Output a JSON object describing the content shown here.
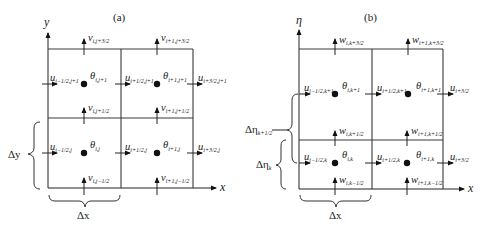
{
  "panels": [
    {
      "id": "a",
      "title": "(a)",
      "vertical_axis": "y",
      "horizontal_axis": "x",
      "dx_label": "Δx",
      "dy_label": "Δy",
      "cells": [
        {
          "theta": "θ",
          "theta_sub": "i,j+1"
        },
        {
          "theta": "θ",
          "theta_sub": "i+1,j+1"
        },
        {
          "theta": "θ",
          "theta_sub": "i,j"
        },
        {
          "theta": "θ",
          "theta_sub": "i+1,j"
        }
      ],
      "u_labels": [
        {
          "var": "u",
          "sub": "i−1/2,j+1"
        },
        {
          "var": "u",
          "sub": "i+1/2,j+1"
        },
        {
          "var": "u",
          "sub": "i+3/2,j+1"
        },
        {
          "var": "u",
          "sub": "i−1/2,j"
        },
        {
          "var": "u",
          "sub": "i+1/2,j"
        },
        {
          "var": "u",
          "sub": "i+3/2,j"
        }
      ],
      "v_labels": [
        {
          "var": "v",
          "sub": "i,j+3/2"
        },
        {
          "var": "v",
          "sub": "i+1,j+3/2"
        },
        {
          "var": "v",
          "sub": "i,j+1/2"
        },
        {
          "var": "v",
          "sub": "i+1,j+1/2"
        },
        {
          "var": "v",
          "sub": "i,j−1/2"
        },
        {
          "var": "v",
          "sub": "i+1,j−1/2"
        }
      ]
    },
    {
      "id": "b",
      "title": "(b)",
      "vertical_axis": "η",
      "horizontal_axis": "x",
      "dx_label": "Δx",
      "deta_upper_label": "Δη",
      "deta_upper_sub": "k+1/2",
      "deta_lower_label": "Δη",
      "deta_lower_sub": "k",
      "cells": [
        {
          "theta": "θ",
          "theta_sub": "i,k+1"
        },
        {
          "theta": "θ",
          "theta_sub": "i+1,k+1"
        },
        {
          "theta": "θ",
          "theta_sub": "i,k"
        },
        {
          "theta": "θ",
          "theta_sub": "i+1,k"
        }
      ],
      "u_labels": [
        {
          "var": "u",
          "sub": "i−1/2,k+1"
        },
        {
          "var": "u",
          "sub": "i+1/2,k+1"
        },
        {
          "var": "u",
          "sub": "i+3/2"
        },
        {
          "var": "u",
          "sub": "i−1/2,k"
        },
        {
          "var": "u",
          "sub": "i+1/2,k"
        },
        {
          "var": "u",
          "sub": "i+3/2"
        }
      ],
      "w_labels": [
        {
          "var": "w",
          "sub": "i,k+3/2"
        },
        {
          "var": "w",
          "sub": "i+1,k+3/2"
        },
        {
          "var": "w",
          "sub": "i,k+1/2"
        },
        {
          "var": "w",
          "sub": "i+1,k+1/2"
        },
        {
          "var": "w",
          "sub": "i,k−1/2"
        },
        {
          "var": "w",
          "sub": "i+1,k−1/2"
        }
      ]
    }
  ]
}
